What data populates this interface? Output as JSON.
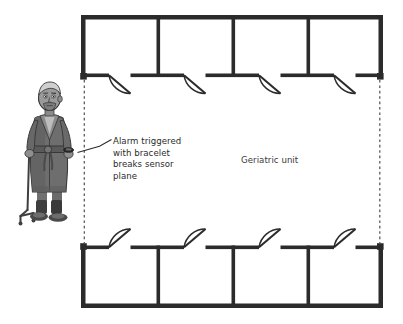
{
  "diagram": {
    "type": "floor-plan",
    "unit_label": "Geriatric unit",
    "annotation": {
      "lines": [
        "Alarm triggered",
        "with bracelet",
        "breaks sensor",
        "plane"
      ],
      "text": "Alarm triggered with bracelet breaks sensor plane",
      "line1": "Alarm triggered",
      "line2": "with bracelet",
      "line3": "breaks sensor",
      "line4": "plane"
    },
    "colors": {
      "wall": "#2b2b2b",
      "background": "#ffffff",
      "text": "#2b2b2b",
      "unit_label_text": "#3a3a3a",
      "sensor_marker": "#2b2b2b",
      "sensor_plane": "#555555",
      "robe_dark": "#4a4a4a",
      "robe_mid": "#6e6e6e",
      "robe_light": "#8c8c8c",
      "skin": "#9a9a9a",
      "hair": "#d0d0d0"
    },
    "rooms": {
      "top_count": 4,
      "bottom_count": 4,
      "top_labels": [
        "",
        "",
        "",
        ""
      ],
      "bottom_labels": [
        "",
        "",
        "",
        ""
      ]
    },
    "doors": {
      "top_count": 4,
      "bottom_count": 4,
      "top_swing": "into-corridor-down",
      "bottom_swing": "into-corridor-up"
    },
    "sensor_markers": {
      "count": 4,
      "positions": [
        "top-left",
        "top-right",
        "bottom-left",
        "bottom-right"
      ]
    },
    "sensor_planes": {
      "count": 2,
      "style": "dashed-vertical",
      "labels": [
        "left-plane",
        "right-plane"
      ]
    },
    "figure": {
      "name": "elderly-patient",
      "description": "elderly man in bathrobe with quad cane and alarm bracelet",
      "has_bracelet": true,
      "has_cane": true
    }
  }
}
